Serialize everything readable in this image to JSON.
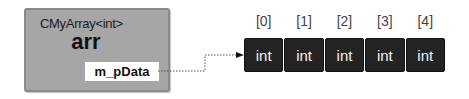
{
  "object": {
    "type_label": "CMyArray<int>",
    "name": "arr",
    "member": "m_pData",
    "box_color": "#a6a6a6"
  },
  "pointer": {
    "style": "dotted",
    "from": "m_pData",
    "to": "array[0]"
  },
  "array": {
    "indices": [
      "[0]",
      "[1]",
      "[2]",
      "[3]",
      "[4]"
    ],
    "cells": [
      "int",
      "int",
      "int",
      "int",
      "int"
    ],
    "cell_color": "#232323"
  }
}
